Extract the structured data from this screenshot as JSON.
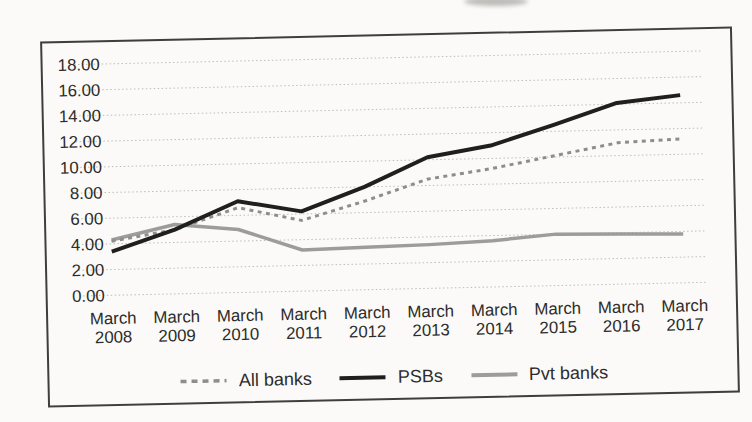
{
  "figure": {
    "background_color": "#fbfaf8",
    "border_color": "#3f3e3b",
    "axis_label_color": "#2d2c2a",
    "gridline_color": "#bcbcbc",
    "gridline_style": "dotted-horizontal"
  },
  "chart_data": {
    "type": "line",
    "title": "",
    "xlabel": "",
    "ylabel": "",
    "categories": [
      "March 2008",
      "March 2009",
      "March 2010",
      "March 2011",
      "March 2012",
      "March 2013",
      "March 2014",
      "March 2015",
      "March 2016",
      "March 2017"
    ],
    "series": [
      {
        "name": "All banks",
        "line_style": "dashed",
        "color": "#8d8d8d",
        "values": [
          4.2,
          5.0,
          6.6,
          5.5,
          6.9,
          8.5,
          9.2,
          10.1,
          11.0,
          11.2
        ]
      },
      {
        "name": "PSBs",
        "line_style": "solid",
        "color": "#1f1f1f",
        "values": [
          3.4,
          5.0,
          7.1,
          6.2,
          8.0,
          10.2,
          11.0,
          12.5,
          14.1,
          14.6
        ]
      },
      {
        "name": "Pvt banks",
        "line_style": "solid",
        "color": "#9c9c9c",
        "values": [
          4.3,
          5.4,
          4.9,
          3.2,
          3.3,
          3.4,
          3.6,
          4.0,
          3.9,
          3.8
        ]
      }
    ],
    "ylim": [
      0,
      18
    ],
    "ytick_step": 2,
    "y_ticks": [
      "0.00",
      "2.00",
      "4.00",
      "6.00",
      "8.00",
      "10.00",
      "12.00",
      "14.00",
      "16.00",
      "18.00"
    ],
    "grid": "horizontal dotted",
    "legend_position": "bottom-center"
  }
}
